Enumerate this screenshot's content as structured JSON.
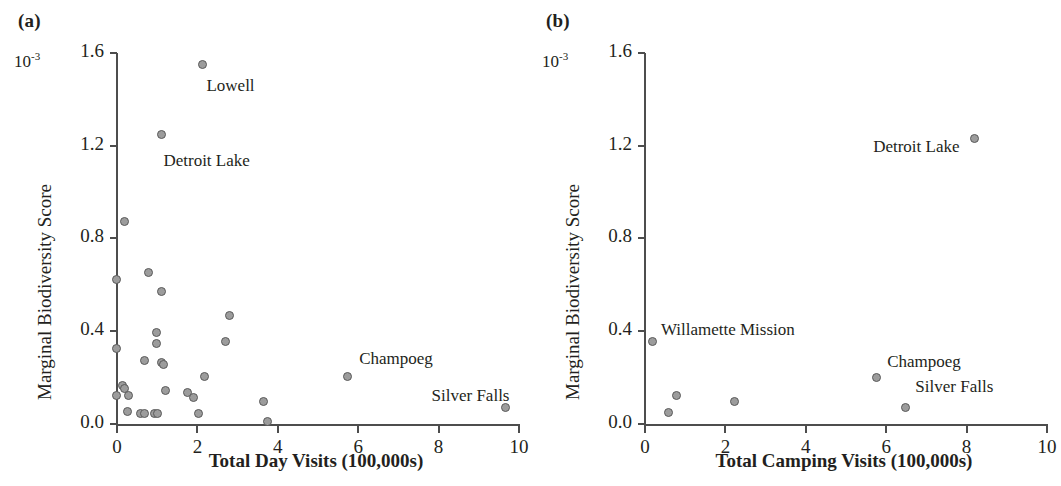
{
  "figure": {
    "background": "#ffffff",
    "marker_fill": "#9c9c9c",
    "marker_edge": "#5a5a5a",
    "axis_color": "#4d4d4d"
  },
  "panels": [
    {
      "tag": "(a)",
      "multiplier": "10",
      "multiplier_exp": "-3",
      "ylabel": "Marginal Biodiversity Score",
      "xlabel": "Total Day Visits (100,000s)",
      "yticks": [
        "0.0",
        "0.4",
        "0.8",
        "1.2",
        "1.6"
      ],
      "xticks": [
        "0",
        "2",
        "4",
        "6",
        "8",
        "10"
      ],
      "annotations": [
        {
          "text": "Lowell",
          "x": 2.25,
          "y": 1.455
        },
        {
          "text": "Detroit Lake",
          "x": 1.18,
          "y": 1.13
        },
        {
          "text": "Champoeg",
          "x": 6.05,
          "y": 0.275
        },
        {
          "text": "Silver Falls",
          "x": 7.85,
          "y": 0.115
        }
      ]
    },
    {
      "tag": "(b)",
      "multiplier": "10",
      "multiplier_exp": "-3",
      "ylabel": "Marginal Biodiversity Score",
      "xlabel": "Total Camping Visits (100,000s)",
      "yticks": [
        "0.0",
        "0.4",
        "0.8",
        "1.2",
        "1.6"
      ],
      "xticks": [
        "0",
        "2",
        "4",
        "6",
        "8",
        "10"
      ],
      "annotations": [
        {
          "text": "Willamette Mission",
          "x": 0.42,
          "y": 0.4
        },
        {
          "text": "Detroit Lake",
          "x": 5.7,
          "y": 1.19
        },
        {
          "text": "Champoeg",
          "x": 6.05,
          "y": 0.265
        },
        {
          "text": "Silver Falls",
          "x": 6.75,
          "y": 0.155
        }
      ]
    }
  ],
  "chart_data": [
    {
      "type": "scatter",
      "panel": "(a)",
      "title": "",
      "xlabel": "Total Day Visits (100,000s)",
      "ylabel": "Marginal Biodiversity Score",
      "y_multiplier": "10^-3",
      "xlim": [
        0,
        10
      ],
      "ylim": [
        0.0,
        1.6
      ],
      "xticks": [
        0,
        2,
        4,
        6,
        8,
        10
      ],
      "yticks": [
        0.0,
        0.4,
        0.8,
        1.2,
        1.6
      ],
      "grid": false,
      "legend": "none",
      "points": [
        {
          "x": 2.16,
          "y": 1.55,
          "label": "Lowell"
        },
        {
          "x": 1.14,
          "y": 1.25,
          "label": "Detroit Lake"
        },
        {
          "x": 0.22,
          "y": 0.875,
          "label": ""
        },
        {
          "x": 0.8,
          "y": 0.655,
          "label": ""
        },
        {
          "x": 0.02,
          "y": 0.625,
          "label": ""
        },
        {
          "x": 1.12,
          "y": 0.57,
          "label": ""
        },
        {
          "x": 2.82,
          "y": 0.47,
          "label": ""
        },
        {
          "x": 1.0,
          "y": 0.395,
          "label": ""
        },
        {
          "x": 1.0,
          "y": 0.345,
          "label": ""
        },
        {
          "x": 0.02,
          "y": 0.325,
          "label": ""
        },
        {
          "x": 2.72,
          "y": 0.355,
          "label": ""
        },
        {
          "x": 0.72,
          "y": 0.275,
          "label": ""
        },
        {
          "x": 1.12,
          "y": 0.265,
          "label": ""
        },
        {
          "x": 1.18,
          "y": 0.255,
          "label": ""
        },
        {
          "x": 2.2,
          "y": 0.205,
          "label": ""
        },
        {
          "x": 5.75,
          "y": 0.205,
          "label": "Champoeg"
        },
        {
          "x": 0.16,
          "y": 0.165,
          "label": ""
        },
        {
          "x": 0.22,
          "y": 0.155,
          "label": ""
        },
        {
          "x": 1.22,
          "y": 0.145,
          "label": ""
        },
        {
          "x": 1.78,
          "y": 0.135,
          "label": ""
        },
        {
          "x": 0.02,
          "y": 0.125,
          "label": ""
        },
        {
          "x": 0.3,
          "y": 0.125,
          "label": ""
        },
        {
          "x": 1.92,
          "y": 0.115,
          "label": ""
        },
        {
          "x": 3.68,
          "y": 0.095,
          "label": ""
        },
        {
          "x": 9.7,
          "y": 0.07,
          "label": "Silver Falls"
        },
        {
          "x": 0.28,
          "y": 0.055,
          "label": ""
        },
        {
          "x": 0.62,
          "y": 0.045,
          "label": ""
        },
        {
          "x": 0.7,
          "y": 0.045,
          "label": ""
        },
        {
          "x": 0.96,
          "y": 0.045,
          "label": ""
        },
        {
          "x": 1.04,
          "y": 0.045,
          "label": ""
        },
        {
          "x": 2.06,
          "y": 0.045,
          "label": ""
        },
        {
          "x": 3.78,
          "y": 0.01,
          "label": ""
        }
      ]
    },
    {
      "type": "scatter",
      "panel": "(b)",
      "title": "",
      "xlabel": "Total Camping Visits (100,000s)",
      "ylabel": "Marginal Biodiversity Score",
      "y_multiplier": "10^-3",
      "xlim": [
        0,
        10
      ],
      "ylim": [
        0.0,
        1.6
      ],
      "xticks": [
        0,
        2,
        4,
        6,
        8,
        10
      ],
      "yticks": [
        0.0,
        0.4,
        0.8,
        1.2,
        1.6
      ],
      "grid": false,
      "legend": "none",
      "points": [
        {
          "x": 8.22,
          "y": 1.23,
          "label": "Detroit Lake"
        },
        {
          "x": 0.2,
          "y": 0.355,
          "label": "Willamette Mission"
        },
        {
          "x": 5.78,
          "y": 0.2,
          "label": "Champoeg"
        },
        {
          "x": 0.82,
          "y": 0.125,
          "label": ""
        },
        {
          "x": 2.26,
          "y": 0.095,
          "label": ""
        },
        {
          "x": 6.5,
          "y": 0.07,
          "label": "Silver Falls"
        },
        {
          "x": 0.62,
          "y": 0.05,
          "label": ""
        }
      ]
    }
  ]
}
